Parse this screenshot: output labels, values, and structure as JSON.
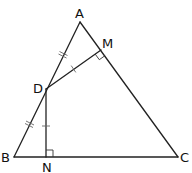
{
  "diagram": {
    "type": "geometry-triangle",
    "points": {
      "A": {
        "label": "A",
        "x": 80,
        "y": 22
      },
      "B": {
        "label": "B",
        "x": 14,
        "y": 157
      },
      "C": {
        "label": "C",
        "x": 178,
        "y": 157
      },
      "D": {
        "label": "D",
        "x": 46,
        "y": 89
      },
      "M": {
        "label": "M",
        "x": 101,
        "y": 50
      },
      "N": {
        "label": "N",
        "x": 46,
        "y": 157
      }
    },
    "labels": {
      "A": "A",
      "B": "B",
      "C": "C",
      "D": "D",
      "M": "M",
      "N": "N"
    },
    "segments": [
      {
        "from": "A",
        "to": "B"
      },
      {
        "from": "B",
        "to": "C"
      },
      {
        "from": "C",
        "to": "A"
      },
      {
        "from": "D",
        "to": "M"
      },
      {
        "from": "D",
        "to": "N"
      }
    ],
    "equal_marks": [
      {
        "segment": "AD",
        "ticks": 2
      },
      {
        "segment": "DB",
        "ticks": 2
      },
      {
        "segment": "DM",
        "ticks": 1
      },
      {
        "segment": "DN",
        "ticks": 1
      }
    ],
    "right_angles": [
      "M",
      "N"
    ],
    "colors": {
      "line": "#222222",
      "tick": "#666666",
      "background": "#ffffff"
    }
  }
}
